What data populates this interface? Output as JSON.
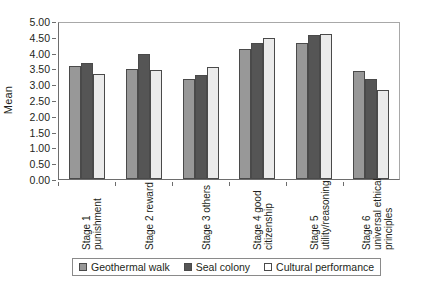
{
  "chart_data": {
    "type": "bar",
    "title": "",
    "xlabel": "",
    "ylabel": "Mean",
    "ylim": [
      0.0,
      5.0
    ],
    "ytick_step": 0.5,
    "grid": false,
    "legend_position": "bottom",
    "ytick_labels": [
      "5.00",
      "4.50",
      "4.00",
      "3.50",
      "3.00",
      "2.50",
      "2.00",
      "1.50",
      "1.00",
      "0.50",
      "0.00"
    ],
    "categories": [
      "Stage 1 punishment",
      "Stage 2 reward",
      "Stage 3 others",
      "Stage 4 good citizenship",
      "Stage 5 utility/reasoning",
      "Stage 6 universal ethical principles"
    ],
    "category_lines": [
      [
        "Stage 1",
        "punishment"
      ],
      [
        "Stage 2 reward"
      ],
      [
        "Stage 3 others"
      ],
      [
        "Stage 4 good",
        "citizenship"
      ],
      [
        "Stage 5",
        "utility/reasoning"
      ],
      [
        "Stage 6",
        "universal ethical",
        "principles"
      ]
    ],
    "series": [
      {
        "name": "Geothermal walk",
        "color": "#989898",
        "values": [
          3.58,
          3.47,
          3.15,
          4.12,
          4.32,
          3.42
        ]
      },
      {
        "name": "Seal colony",
        "color": "#555555",
        "values": [
          3.67,
          3.97,
          3.3,
          4.32,
          4.55,
          3.15
        ]
      },
      {
        "name": "Cultural performance",
        "color": "#ebebeb",
        "values": [
          3.33,
          3.45,
          3.55,
          4.46,
          4.58,
          2.83
        ]
      }
    ]
  }
}
